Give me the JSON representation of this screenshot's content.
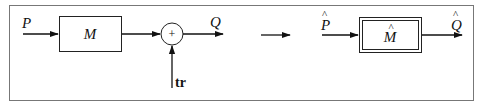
{
  "diagram": {
    "left": {
      "input_label": "P",
      "block_label": "M",
      "summing_symbol": "+",
      "output_label": "Q",
      "disturbance_label": "tr"
    },
    "transform_arrow": "right-arrow",
    "right": {
      "input_label": "P",
      "input_hat": "^",
      "block_label": "M",
      "block_hat": "^",
      "output_label": "Q",
      "output_hat": "^"
    }
  }
}
